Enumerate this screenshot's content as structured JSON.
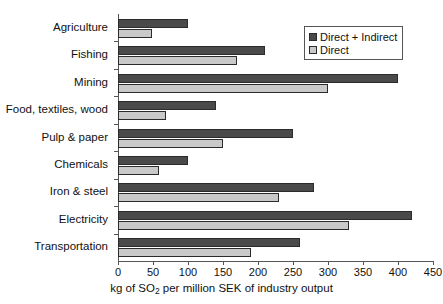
{
  "chart_data": {
    "type": "bar",
    "orientation": "horizontal",
    "title": "",
    "xlabel": "kg of SO2 per million SEK of industry output",
    "xlabel_parts": {
      "pre": "kg of SO",
      "sub": "2",
      "post": " per million SEK of industry output"
    },
    "ylabel": "",
    "categories": [
      "Agriculture",
      "Fishing",
      "Mining",
      "Food, textiles, wood",
      "Pulp & paper",
      "Chemicals",
      "Iron & steel",
      "Electricity",
      "Transportation"
    ],
    "series": [
      {
        "name": "Direct + Indirect",
        "color": "#4a4a4a",
        "values": [
          100,
          210,
          400,
          140,
          250,
          100,
          280,
          420,
          260
        ]
      },
      {
        "name": "Direct",
        "color": "#c9c9c9",
        "values": [
          48,
          170,
          300,
          68,
          150,
          58,
          230,
          330,
          190
        ]
      }
    ],
    "xlim": [
      0,
      450
    ],
    "xticks": [
      0,
      50,
      100,
      150,
      200,
      250,
      300,
      350,
      400,
      450
    ],
    "xtick_labels": [
      "0",
      "50",
      "100",
      "150",
      "200",
      "250",
      "300",
      "350",
      "400",
      "450"
    ],
    "grid": false,
    "legend_position": "top-right",
    "legend_entries": [
      "Direct + Indirect",
      "Direct"
    ]
  }
}
